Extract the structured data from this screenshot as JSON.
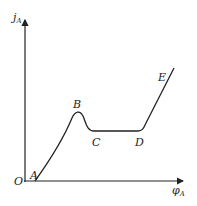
{
  "diagram": {
    "y_axis_label": "j",
    "y_axis_sub": "A",
    "x_axis_label": "φ",
    "x_axis_sub": "A",
    "origin_label": "O",
    "points": [
      {
        "label": "A",
        "x": 35,
        "y": 181
      },
      {
        "label": "B",
        "x": 78,
        "y": 113
      },
      {
        "label": "C",
        "x": 92,
        "y": 131
      },
      {
        "label": "D",
        "x": 142,
        "y": 131
      },
      {
        "label": "E",
        "x": 174,
        "y": 68
      }
    ],
    "line_color": "#222222"
  }
}
